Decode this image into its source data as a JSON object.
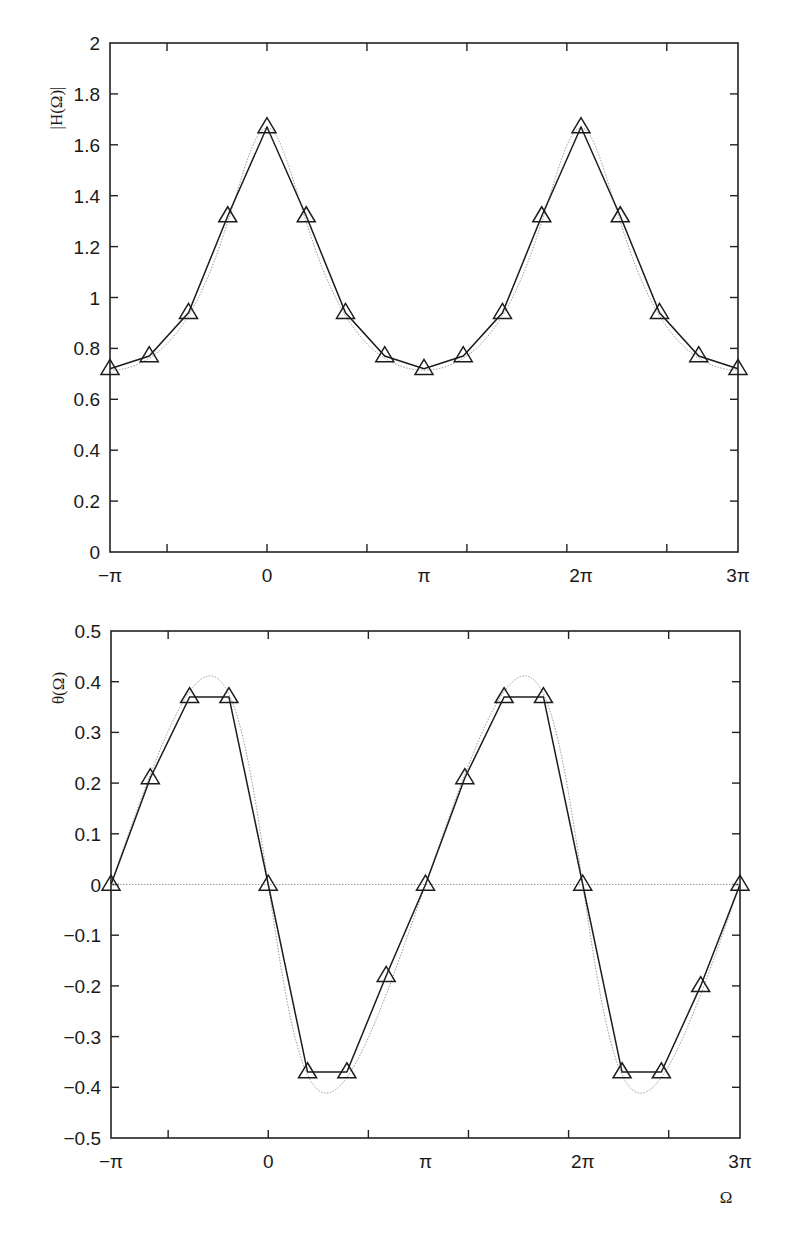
{
  "chart_data": [
    {
      "type": "line",
      "title": "",
      "xlabel": "",
      "ylabel": "|H(Ω)|",
      "xlim": [
        -3.14159,
        9.42478
      ],
      "ylim": [
        0,
        2
      ],
      "grid": false,
      "legend": null,
      "y_ticks": [
        0,
        0.2,
        0.4,
        0.6,
        0.8,
        1,
        1.2,
        1.4,
        1.6,
        1.8,
        2
      ],
      "y_tick_labels": [
        "0",
        "0.2",
        "0.4",
        "0.6",
        "0.8",
        "1",
        "1.2",
        "1.4",
        "1.6",
        "1.8",
        "2"
      ],
      "x_tick_marks": [
        -2,
        0,
        2,
        4,
        6,
        8
      ],
      "x_tick_labels": [
        {
          "value": -3.14159,
          "label": "−π"
        },
        {
          "value": 0,
          "label": "0"
        },
        {
          "value": 3.14159,
          "label": "π"
        },
        {
          "value": 6.28319,
          "label": "2π"
        },
        {
          "value": 9.42478,
          "label": "3π"
        }
      ],
      "x_labels_text": [
        "−π",
        "0",
        "π",
        "2π",
        "3π"
      ],
      "series": [
        {
          "name": "sampled",
          "style": "solid line with triangle markers",
          "x_in_pi_units": [
            -1,
            -0.75,
            -0.5,
            -0.25,
            0,
            0.25,
            0.5,
            0.75,
            1,
            1.25,
            1.5,
            1.75,
            2,
            2.25,
            2.5,
            2.75,
            3
          ],
          "values": [
            0.72,
            0.77,
            0.94,
            1.32,
            1.67,
            1.32,
            0.94,
            0.77,
            0.72,
            0.77,
            0.94,
            1.32,
            1.67,
            1.32,
            0.94,
            0.77,
            0.72
          ]
        },
        {
          "name": "continuous",
          "style": "dotted grey curve",
          "formula": "1/|1 - 0.4 e^{-jΩ}|",
          "peak": 1.667,
          "trough": 0.714
        }
      ]
    },
    {
      "type": "line",
      "title": "",
      "xlabel": "Ω",
      "ylabel": "θ(Ω)",
      "xlim": [
        -3.14159,
        9.42478
      ],
      "ylim": [
        -0.5,
        0.5
      ],
      "grid": false,
      "legend": null,
      "y_ticks": [
        -0.5,
        -0.4,
        -0.3,
        -0.2,
        -0.1,
        0,
        0.1,
        0.2,
        0.3,
        0.4,
        0.5
      ],
      "y_tick_labels": [
        "−0.5",
        "−0.4",
        "−0.3",
        "−0.2",
        "−0.1",
        "0",
        "0.1",
        "0.2",
        "0.3",
        "0.4",
        "0.5"
      ],
      "x_tick_marks": [
        -2,
        0,
        2,
        4,
        6,
        8
      ],
      "x_tick_labels": [
        {
          "value": -3.14159,
          "label": "−π"
        },
        {
          "value": 0,
          "label": "0"
        },
        {
          "value": 3.14159,
          "label": "π"
        },
        {
          "value": 6.28319,
          "label": "2π"
        },
        {
          "value": 9.42478,
          "label": "3π"
        }
      ],
      "x_labels_text": [
        "−π",
        "0",
        "π",
        "2π",
        "3π"
      ],
      "series": [
        {
          "name": "sampled",
          "style": "solid line with triangle markers",
          "x_in_pi_units": [
            -1,
            -0.75,
            -0.5,
            -0.25,
            0,
            0.25,
            0.5,
            0.75,
            1,
            1.25,
            1.5,
            1.75,
            2,
            2.25,
            2.5,
            2.75,
            3
          ],
          "values": [
            0,
            0.21,
            0.37,
            0.37,
            0,
            -0.37,
            -0.37,
            -0.18,
            0,
            0.21,
            0.37,
            0.37,
            0,
            -0.37,
            -0.37,
            -0.2,
            0
          ]
        },
        {
          "name": "continuous",
          "style": "dotted grey curve",
          "formula": "-atan(0.4 sinΩ / (1 - 0.4 cosΩ))",
          "max": 0.41,
          "min": -0.41
        },
        {
          "name": "zero-reference",
          "style": "dotted horizontal line at 0"
        }
      ]
    }
  ],
  "top_chart": {
    "ylabel": "|H(Ω)|"
  },
  "bottom_chart": {
    "ylabel": "θ(Ω)",
    "xlabel": "Ω"
  }
}
